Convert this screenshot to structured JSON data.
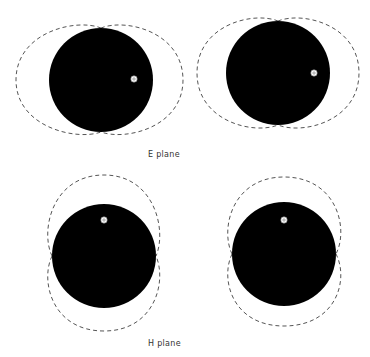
{
  "colors": {
    "background": "#ffffff",
    "conductor": "#000000",
    "pattern": "#555555",
    "marker_fill": "#ffffff",
    "marker_stroke": "#777777",
    "label": "#333333"
  },
  "labels": {
    "e_plane": "E plane",
    "h_plane": "H plane"
  },
  "panels": [
    {
      "id": "e-plane-left",
      "plane": "E",
      "cx": 101,
      "cy": 80,
      "r": 52,
      "marker": {
        "x": 134,
        "y": 79,
        "icon": "feed-point-icon"
      },
      "lobes": "horizontal",
      "lobe_extent": {
        "x_min": 16,
        "x_max": 183,
        "y_min": 22,
        "y_max": 137
      }
    },
    {
      "id": "e-plane-right",
      "plane": "E",
      "cx": 278,
      "cy": 73,
      "r": 52,
      "marker": {
        "x": 314,
        "y": 73,
        "icon": "feed-point-icon"
      },
      "lobes": "horizontal",
      "lobe_extent": {
        "x_min": 197,
        "x_max": 359,
        "y_min": 15,
        "y_max": 131
      }
    },
    {
      "id": "h-plane-left",
      "plane": "H",
      "cx": 104,
      "cy": 256,
      "r": 52,
      "marker": {
        "x": 104,
        "y": 220,
        "icon": "feed-point-icon"
      },
      "lobes": "vertical",
      "lobe_extent": {
        "x_min": 44,
        "x_max": 163,
        "y_min": 175,
        "y_max": 331
      }
    },
    {
      "id": "h-plane-right",
      "plane": "H",
      "cx": 284,
      "cy": 254,
      "r": 52,
      "marker": {
        "x": 284,
        "y": 220,
        "icon": "feed-point-icon"
      },
      "lobes": "vertical",
      "lobe_extent": {
        "x_min": 224,
        "x_max": 345,
        "y_min": 177,
        "y_max": 326
      }
    }
  ],
  "label_positions": {
    "e_plane": {
      "x": 148,
      "y": 150
    },
    "h_plane": {
      "x": 148,
      "y": 339
    }
  }
}
